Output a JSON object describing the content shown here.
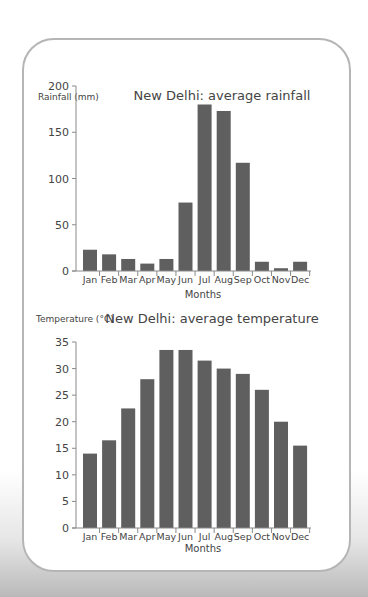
{
  "theme": {
    "bar_color": "#5f5f5f",
    "axis_color": "#8a8a8a",
    "text_color": "#444444",
    "border_color": "#b5b5b5"
  },
  "chart_data": [
    {
      "type": "bar",
      "title": "New Delhi: average rainfall",
      "xlabel": "Months",
      "ylabel": "Rainfall (mm)",
      "categories": [
        "Jan",
        "Feb",
        "Mar",
        "Apr",
        "May",
        "Jun",
        "Jul",
        "Aug",
        "Sep",
        "Oct",
        "Nov",
        "Dec"
      ],
      "values": [
        23,
        18,
        13,
        8,
        13,
        74,
        180,
        173,
        117,
        10,
        3,
        10
      ],
      "ylim": [
        0,
        200
      ],
      "yticks": [
        0,
        50,
        100,
        150,
        200
      ],
      "grid": false,
      "legend": "none"
    },
    {
      "type": "bar",
      "title": "New Delhi: average temperature",
      "xlabel": "Months",
      "ylabel": "Temperature (°C)",
      "categories": [
        "Jan",
        "Feb",
        "Mar",
        "Apr",
        "May",
        "Jun",
        "Jul",
        "Aug",
        "Sep",
        "Oct",
        "Nov",
        "Dec"
      ],
      "values": [
        14,
        16.5,
        22.5,
        28,
        33.5,
        33.5,
        31.5,
        30,
        29,
        26,
        20,
        15.5
      ],
      "ylim": [
        0,
        35
      ],
      "yticks": [
        0,
        5,
        10,
        15,
        20,
        25,
        30,
        35
      ],
      "grid": false,
      "legend": "none"
    }
  ]
}
